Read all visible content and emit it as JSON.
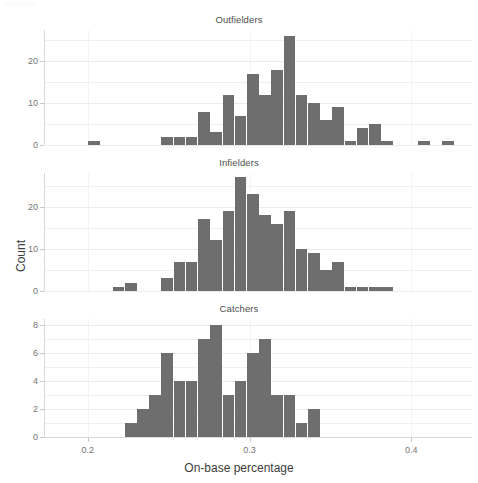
{
  "axis": {
    "x_title": "On-base percentage",
    "y_title": "Count",
    "x_ticks": [
      {
        "value": 0.2,
        "label": "0.2"
      },
      {
        "value": 0.3,
        "label": "0.3"
      },
      {
        "value": 0.4,
        "label": "0.4"
      }
    ],
    "x_min": 0.1735,
    "x_max": 0.4375
  },
  "panels": [
    {
      "title": "Outfielders",
      "y_ticks": [
        {
          "value": 0,
          "label": "0"
        },
        {
          "value": 10,
          "label": "10"
        },
        {
          "value": 20,
          "label": "20"
        }
      ],
      "y_minor": [
        5,
        15,
        25
      ],
      "y_max": 27.5
    },
    {
      "title": "Infielders",
      "y_ticks": [
        {
          "value": 0,
          "label": "0"
        },
        {
          "value": 10,
          "label": "10"
        },
        {
          "value": 20,
          "label": "20"
        }
      ],
      "y_minor": [
        5,
        15,
        25
      ],
      "y_max": 28.0
    },
    {
      "title": "Catchers",
      "y_ticks": [
        {
          "value": 0,
          "label": "0"
        },
        {
          "value": 2,
          "label": "2"
        },
        {
          "value": 4,
          "label": "4"
        },
        {
          "value": 6,
          "label": "6"
        },
        {
          "value": 8,
          "label": "8"
        }
      ],
      "y_minor": [
        1,
        3,
        5,
        7
      ],
      "y_max": 8.4
    }
  ],
  "chart_data": {
    "type": "bar",
    "title": "",
    "xlabel": "On-base percentage",
    "ylabel": "Count",
    "grid": true,
    "legend": "none",
    "layout": "3 stacked facet panels sharing the x-axis",
    "bin_width": 0.00755,
    "xlim": [
      0.1735,
      0.4375
    ],
    "panels": [
      {
        "name": "Outfielders",
        "ylim": [
          0,
          27.5
        ],
        "yticks": [
          0,
          10,
          20
        ],
        "bin_starts": [
          0.2002,
          0.2455,
          0.2531,
          0.2606,
          0.2682,
          0.2757,
          0.2833,
          0.2908,
          0.2984,
          0.3059,
          0.3135,
          0.321,
          0.3286,
          0.3361,
          0.3437,
          0.3512,
          0.3588,
          0.3663,
          0.3739,
          0.3814,
          0.4041,
          0.4192
        ],
        "values": [
          1,
          2,
          2,
          2,
          8,
          3,
          12,
          7,
          17,
          12,
          18,
          26,
          12,
          10,
          6,
          9,
          1,
          4,
          5,
          1,
          1,
          1
        ]
      },
      {
        "name": "Infielders",
        "ylim": [
          0,
          28.0
        ],
        "yticks": [
          0,
          10,
          20
        ],
        "bin_starts": [
          0.2153,
          0.2229,
          0.2455,
          0.2531,
          0.2606,
          0.2682,
          0.2757,
          0.2833,
          0.2908,
          0.2984,
          0.3059,
          0.3135,
          0.321,
          0.3286,
          0.3361,
          0.3437,
          0.3512,
          0.3588,
          0.3663,
          0.3739,
          0.3814
        ],
        "values": [
          1,
          2,
          3,
          7,
          7,
          17,
          12,
          19,
          27,
          23,
          18,
          16,
          19,
          10,
          9,
          5,
          7,
          1,
          1,
          1,
          1
        ]
      },
      {
        "name": "Catchers",
        "ylim": [
          0,
          8.4
        ],
        "yticks": [
          0,
          2,
          4,
          6,
          8
        ],
        "bin_starts": [
          0.2229,
          0.2304,
          0.238,
          0.2455,
          0.2531,
          0.2606,
          0.2682,
          0.2757,
          0.2833,
          0.2908,
          0.2984,
          0.3059,
          0.3135,
          0.321,
          0.3286,
          0.3361,
          0.3437,
          0.3512,
          0.3588,
          0.3663,
          0.3739
        ],
        "values": [
          1,
          2,
          3,
          6,
          4,
          4,
          7,
          8,
          3,
          4,
          6,
          7,
          3,
          3,
          1,
          2,
          0,
          0,
          0,
          0,
          0
        ]
      }
    ]
  }
}
